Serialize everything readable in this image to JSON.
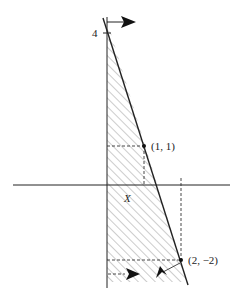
{
  "figure": {
    "type": "feasible-region-diagram",
    "axis_tick_label_y": "4",
    "points": [
      {
        "label": "(1, 1)",
        "x": 1,
        "y": 1
      },
      {
        "label": "(2, −2)",
        "x": 2,
        "y": -2
      }
    ],
    "region_label": "X",
    "line": {
      "through": [
        [
          0,
          4
        ],
        [
          1,
          1
        ],
        [
          2,
          -2
        ]
      ]
    },
    "colors": {
      "line": "#222222",
      "hatch": "#9a9a9a",
      "background": "#ffffff"
    }
  }
}
